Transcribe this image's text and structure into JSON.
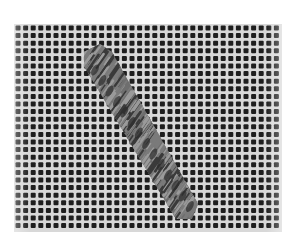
{
  "image": {
    "subject": "Needlepoint canvas with a diagonal band of slanted stitches",
    "style": "grayscale photograph",
    "background_color": "#ffffff",
    "canvas": {
      "x": 14,
      "y": 24,
      "width": 268,
      "height": 208,
      "thread_color": "#d8d8d8",
      "hole_color": "#1e1e1e",
      "pitch": 7.6,
      "hole_size": 5
    },
    "stitch_band": {
      "direction": "top-left to bottom-right",
      "polygon": [
        [
          84,
          52
        ],
        [
          100,
          44
        ],
        [
          112,
          52
        ],
        [
          198,
          204
        ],
        [
          192,
          219
        ],
        [
          176,
          219
        ],
        [
          84,
          66
        ]
      ],
      "stitch_light": "#9a9a9a",
      "stitch_dark": "#3a3a3a"
    }
  }
}
